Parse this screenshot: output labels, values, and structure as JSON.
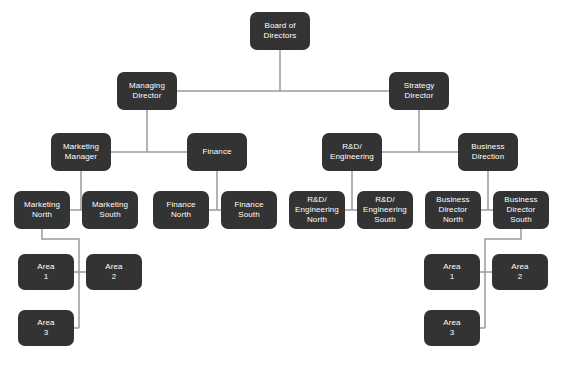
{
  "diagram": {
    "type": "org-chart",
    "canvas": {
      "width": 562,
      "height": 371
    },
    "style": {
      "background_color": "#ffffff",
      "node_fill_color": "#333333",
      "node_text_color": "#ffffff",
      "connector_color": "#9a9a9a",
      "node_corner_radius": 7,
      "connector_width": 1.5
    },
    "levels": [
      "board",
      "directors",
      "departments",
      "regions",
      "areas"
    ],
    "nodes": [
      {
        "id": "board-of-directors",
        "label": "Board of\nDirectors",
        "level": "board",
        "x": 250,
        "y": 12,
        "w": 60,
        "h": 38
      },
      {
        "id": "managing-director",
        "label": "Managing\nDirector",
        "level": "directors",
        "x": 117,
        "y": 72,
        "w": 60,
        "h": 38
      },
      {
        "id": "strategy-director",
        "label": "Strategy\nDirector",
        "level": "directors",
        "x": 389,
        "y": 72,
        "w": 60,
        "h": 38
      },
      {
        "id": "marketing-manager",
        "label": "Marketing\nManager",
        "level": "departments",
        "x": 51,
        "y": 133,
        "w": 60,
        "h": 38
      },
      {
        "id": "finance",
        "label": "Finance",
        "level": "departments",
        "x": 187,
        "y": 133,
        "w": 60,
        "h": 38
      },
      {
        "id": "rd-engineering",
        "label": "R&D/\nEngineering",
        "level": "departments",
        "x": 322,
        "y": 133,
        "w": 60,
        "h": 38
      },
      {
        "id": "business-direction",
        "label": "Business\nDirection",
        "level": "departments",
        "x": 458,
        "y": 133,
        "w": 60,
        "h": 38
      },
      {
        "id": "marketing-north",
        "label": "Marketing\nNorth",
        "level": "regions",
        "x": 14,
        "y": 191,
        "w": 56,
        "h": 38
      },
      {
        "id": "marketing-south",
        "label": "Marketing\nSouth",
        "level": "regions",
        "x": 82,
        "y": 191,
        "w": 56,
        "h": 38
      },
      {
        "id": "finance-north",
        "label": "Finance\nNorth",
        "level": "regions",
        "x": 153,
        "y": 191,
        "w": 56,
        "h": 38
      },
      {
        "id": "finance-south",
        "label": "Finance\nSouth",
        "level": "regions",
        "x": 221,
        "y": 191,
        "w": 56,
        "h": 38
      },
      {
        "id": "rd-engineering-north",
        "label": "R&D/\nEngineering\nNorth",
        "level": "regions",
        "x": 289,
        "y": 191,
        "w": 56,
        "h": 38
      },
      {
        "id": "rd-engineering-south",
        "label": "R&D/\nEngineering\nSouth",
        "level": "regions",
        "x": 357,
        "y": 191,
        "w": 56,
        "h": 38
      },
      {
        "id": "business-director-north",
        "label": "Business\nDirector\nNorth",
        "level": "regions",
        "x": 425,
        "y": 191,
        "w": 56,
        "h": 38
      },
      {
        "id": "business-director-south",
        "label": "Business\nDirector\nSouth",
        "level": "regions",
        "x": 493,
        "y": 191,
        "w": 56,
        "h": 38
      },
      {
        "id": "marketing-area-1",
        "label": "Area\n1",
        "level": "areas",
        "x": 18,
        "y": 254,
        "w": 56,
        "h": 36
      },
      {
        "id": "marketing-area-2",
        "label": "Area\n2",
        "level": "areas",
        "x": 86,
        "y": 254,
        "w": 56,
        "h": 36
      },
      {
        "id": "marketing-area-3",
        "label": "Area\n3",
        "level": "areas",
        "x": 18,
        "y": 310,
        "w": 56,
        "h": 36
      },
      {
        "id": "business-area-1",
        "label": "Area\n1",
        "level": "areas",
        "x": 424,
        "y": 254,
        "w": 56,
        "h": 36
      },
      {
        "id": "business-area-2",
        "label": "Area\n2",
        "level": "areas",
        "x": 492,
        "y": 254,
        "w": 56,
        "h": 36
      },
      {
        "id": "business-area-3",
        "label": "Area\n3",
        "level": "areas",
        "x": 424,
        "y": 310,
        "w": 56,
        "h": 36
      }
    ],
    "edges": [
      {
        "from": "board-of-directors",
        "to": "managing-director"
      },
      {
        "from": "board-of-directors",
        "to": "strategy-director"
      },
      {
        "from": "managing-director",
        "to": "marketing-manager"
      },
      {
        "from": "managing-director",
        "to": "finance"
      },
      {
        "from": "strategy-director",
        "to": "rd-engineering"
      },
      {
        "from": "strategy-director",
        "to": "business-direction"
      },
      {
        "from": "marketing-manager",
        "to": "marketing-north"
      },
      {
        "from": "marketing-manager",
        "to": "marketing-south"
      },
      {
        "from": "finance",
        "to": "finance-north"
      },
      {
        "from": "finance",
        "to": "finance-south"
      },
      {
        "from": "rd-engineering",
        "to": "rd-engineering-north"
      },
      {
        "from": "rd-engineering",
        "to": "rd-engineering-south"
      },
      {
        "from": "business-direction",
        "to": "business-director-north"
      },
      {
        "from": "business-direction",
        "to": "business-director-south"
      },
      {
        "from": "marketing-north",
        "to": "marketing-area-1"
      },
      {
        "from": "marketing-north",
        "to": "marketing-area-2"
      },
      {
        "from": "marketing-north",
        "to": "marketing-area-3"
      },
      {
        "from": "business-director-south",
        "to": "business-area-1"
      },
      {
        "from": "business-director-south",
        "to": "business-area-2"
      },
      {
        "from": "business-director-south",
        "to": "business-area-3"
      }
    ],
    "connector_paths": [
      "M 280 50 L 280 91",
      "M 177 91 L 389 91",
      "M 147 110 L 147 152",
      "M 111 152 L 187 152",
      "M 419 110 L 419 152",
      "M 382 152 L 458 152",
      "M 81 171 L 81 210",
      "M 70 210 L 82 210",
      "M 217 171 L 217 210",
      "M 209 210 L 221 210",
      "M 352 171 L 352 210",
      "M 345 210 L 357 210",
      "M 488 171 L 488 210",
      "M 481 210 L 493 210",
      "M 42 229 L 42 239 L 79 239 L 79 328",
      "M 74 272 L 86 272",
      "M 79 272 L 79 272",
      "M 74 328 L 79 328",
      "M 521 229 L 521 239 L 485 239 L 485 328",
      "M 480 272 L 492 272",
      "M 480 328 L 485 328"
    ]
  }
}
